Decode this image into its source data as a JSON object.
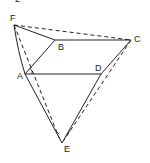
{
  "figure": {
    "top_marker": "2",
    "ink_color": "#222222",
    "background": "#ffffff",
    "points": {
      "F": {
        "label": "F",
        "x": 14,
        "y": 25
      },
      "B": {
        "label": "B",
        "x": 55,
        "y": 40
      },
      "C": {
        "label": "C",
        "x": 131,
        "y": 40
      },
      "A": {
        "label": "A",
        "x": 25,
        "y": 74
      },
      "D": {
        "label": "D",
        "x": 101,
        "y": 74
      },
      "E": {
        "label": "E",
        "x": 62,
        "y": 143
      }
    },
    "solid_edges": [
      [
        "F",
        "B"
      ],
      [
        "B",
        "C"
      ],
      [
        "F",
        "A"
      ],
      [
        "A",
        "B"
      ],
      [
        "A",
        "D"
      ],
      [
        "C",
        "D"
      ],
      [
        "D",
        "E"
      ],
      [
        "A",
        "E"
      ]
    ],
    "dashed_edges": [
      [
        "F",
        "C"
      ],
      [
        "F",
        "E"
      ],
      [
        "C",
        "E"
      ]
    ]
  }
}
